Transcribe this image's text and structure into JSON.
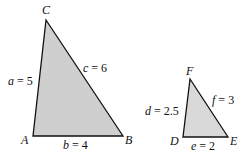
{
  "figure": {
    "fill_color": "#cfcfcf",
    "stroke_color": "#111111",
    "triangles": [
      {
        "name": "ABC",
        "vertices": {
          "A": {
            "label": "A",
            "x": 33,
            "y": 136
          },
          "B": {
            "label": "B",
            "x": 123,
            "y": 136
          },
          "C": {
            "label": "C",
            "x": 46,
            "y": 20
          }
        },
        "sides": {
          "a": {
            "var": "a",
            "value": "5",
            "text": "a = 5"
          },
          "b": {
            "var": "b",
            "value": "4",
            "text": "b = 4"
          },
          "c": {
            "var": "c",
            "value": "6",
            "text": "c = 6"
          }
        }
      },
      {
        "name": "DEF",
        "vertices": {
          "D": {
            "label": "D",
            "x": 183,
            "y": 137
          },
          "E": {
            "label": "E",
            "x": 228,
            "y": 137
          },
          "F": {
            "label": "F",
            "x": 190,
            "y": 79
          }
        },
        "sides": {
          "d": {
            "var": "d",
            "value": "2.5",
            "text": "d = 2.5"
          },
          "e": {
            "var": "e",
            "value": "2",
            "text": "e = 2"
          },
          "f": {
            "var": "f",
            "value": "3",
            "text": "f = 3"
          }
        }
      }
    ]
  }
}
